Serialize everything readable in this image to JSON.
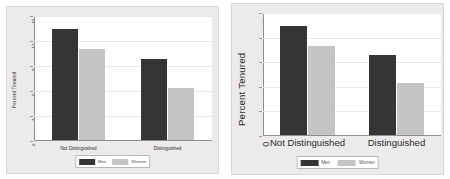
{
  "chart_data": [
    {
      "type": "bar",
      "title": "",
      "xlabel": "",
      "ylabel": "Percent Tenured",
      "categories": [
        "Not Distinguished",
        "Distinguished"
      ],
      "series": [
        {
          "name": "Men",
          "values": [
            13.3,
            9.7
          ],
          "color": "#353535"
        },
        {
          "name": "Women",
          "values": [
            10.9,
            6.3
          ],
          "color": "#c4c4c4"
        }
      ],
      "ylim": [
        0,
        15
      ],
      "yticks": [
        "0",
        "3",
        "6",
        "9",
        "12",
        "15"
      ],
      "grid": true,
      "legend_position": "bottom"
    },
    {
      "type": "bar",
      "title": "",
      "xlabel": "",
      "ylabel": "Percent Tenured",
      "categories": [
        "Not Distinguished",
        "Distinguished"
      ],
      "series": [
        {
          "name": "Men",
          "values": [
            13.3,
            9.7
          ],
          "color": "#353535"
        },
        {
          "name": "Women",
          "values": [
            10.9,
            6.3
          ],
          "color": "#c4c4c4"
        }
      ],
      "ylim": [
        0,
        15
      ],
      "yticks": [
        "0",
        "3",
        "6",
        "9",
        "12",
        "15"
      ],
      "grid": true,
      "legend_position": "bottom"
    }
  ],
  "panels": {
    "left": {
      "ylabel": "Percent Tenured",
      "yticks": [
        "0",
        "3",
        "6",
        "9",
        "12",
        "15"
      ],
      "categories": [
        "Not Distinguished",
        "Distinguished"
      ],
      "legend": [
        "Men",
        "Women"
      ]
    },
    "right": {
      "ylabel": "Percent Tenured",
      "yticks": [
        "0",
        "3",
        "6",
        "9",
        "12",
        "15"
      ],
      "categories": [
        "Not Distinguished",
        "Distinguished"
      ],
      "legend": [
        "Men",
        "Women"
      ]
    }
  },
  "colors": {
    "men": "#353535",
    "women": "#c4c4c4",
    "panel_background": "#eceaea",
    "plot_background": "#ffffff",
    "axis": "#8f8f8f",
    "grid": "#e9e9e9"
  }
}
